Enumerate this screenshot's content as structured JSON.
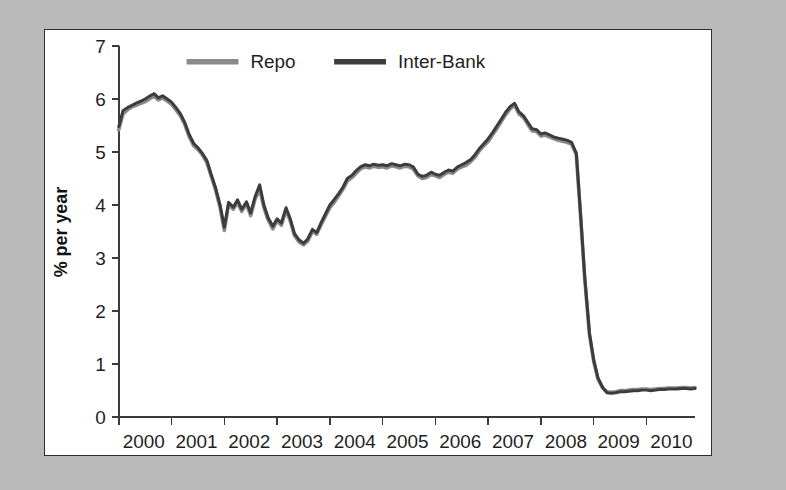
{
  "figure": {
    "background_color": "#b9b9b9",
    "panel_color": "#ffffff",
    "border_color": "#2e2e2e"
  },
  "chart_data": {
    "type": "line",
    "title": "",
    "xlabel": "",
    "ylabel": "% per year",
    "xlim": [
      2000,
      2010.92
    ],
    "ylim": [
      0,
      7
    ],
    "grid": false,
    "legend_position": "top-center",
    "xticks": [
      "2000",
      "2001",
      "2002",
      "2003",
      "2004",
      "2005",
      "2006",
      "2007",
      "2008",
      "2009",
      "2010"
    ],
    "yticks": [
      "0",
      "1",
      "2",
      "3",
      "4",
      "5",
      "6",
      "7"
    ],
    "colors": {
      "repo": "#8a8a8a",
      "inter_bank": "#3c3c3c"
    },
    "series": [
      {
        "name": "Repo",
        "color": "#8a8a8a",
        "x": [
          2000.0,
          2000.08,
          2000.17,
          2000.25,
          2000.33,
          2000.42,
          2000.5,
          2000.58,
          2000.67,
          2000.75,
          2000.83,
          2000.92,
          2001.0,
          2001.08,
          2001.17,
          2001.25,
          2001.33,
          2001.42,
          2001.5,
          2001.58,
          2001.67,
          2001.75,
          2001.83,
          2001.92,
          2002.0,
          2002.08,
          2002.17,
          2002.25,
          2002.33,
          2002.42,
          2002.5,
          2002.58,
          2002.67,
          2002.75,
          2002.83,
          2002.92,
          2003.0,
          2003.08,
          2003.17,
          2003.25,
          2003.33,
          2003.42,
          2003.5,
          2003.58,
          2003.67,
          2003.75,
          2003.83,
          2003.92,
          2004.0,
          2004.08,
          2004.17,
          2004.25,
          2004.33,
          2004.42,
          2004.5,
          2004.58,
          2004.67,
          2004.75,
          2004.83,
          2004.92,
          2005.0,
          2005.08,
          2005.17,
          2005.25,
          2005.33,
          2005.42,
          2005.5,
          2005.58,
          2005.67,
          2005.75,
          2005.83,
          2005.92,
          2006.0,
          2006.08,
          2006.17,
          2006.25,
          2006.33,
          2006.42,
          2006.5,
          2006.58,
          2006.67,
          2006.75,
          2006.83,
          2006.92,
          2007.0,
          2007.08,
          2007.17,
          2007.25,
          2007.33,
          2007.42,
          2007.5,
          2007.58,
          2007.67,
          2007.75,
          2007.83,
          2007.92,
          2008.0,
          2008.08,
          2008.17,
          2008.25,
          2008.33,
          2008.42,
          2008.5,
          2008.58,
          2008.67,
          2008.75,
          2008.83,
          2008.92,
          2009.0,
          2009.08,
          2009.17,
          2009.25,
          2009.33,
          2009.42,
          2009.5,
          2009.58,
          2009.67,
          2009.75,
          2009.83,
          2009.92,
          2010.0,
          2010.08,
          2010.17,
          2010.25,
          2010.33,
          2010.42,
          2010.5,
          2010.58,
          2010.67,
          2010.75,
          2010.83,
          2010.92
        ],
        "y": [
          5.42,
          5.72,
          5.8,
          5.85,
          5.88,
          5.92,
          5.95,
          6.0,
          6.05,
          5.98,
          6.02,
          5.96,
          5.9,
          5.8,
          5.68,
          5.52,
          5.3,
          5.12,
          5.05,
          4.95,
          4.8,
          4.55,
          4.3,
          3.95,
          3.52,
          4.0,
          3.92,
          4.05,
          3.88,
          4.02,
          3.8,
          4.1,
          4.3,
          3.95,
          3.72,
          3.55,
          3.7,
          3.62,
          3.9,
          3.7,
          3.42,
          3.3,
          3.25,
          3.32,
          3.5,
          3.45,
          3.62,
          3.8,
          3.95,
          4.05,
          4.18,
          4.3,
          4.45,
          4.52,
          4.6,
          4.68,
          4.72,
          4.7,
          4.73,
          4.71,
          4.72,
          4.7,
          4.74,
          4.72,
          4.7,
          4.73,
          4.72,
          4.68,
          4.55,
          4.5,
          4.52,
          4.58,
          4.55,
          4.52,
          4.58,
          4.62,
          4.6,
          4.68,
          4.72,
          4.75,
          4.82,
          4.9,
          5.02,
          5.12,
          5.2,
          5.32,
          5.45,
          5.58,
          5.7,
          5.82,
          5.88,
          5.72,
          5.65,
          5.52,
          5.4,
          5.38,
          5.3,
          5.32,
          5.28,
          5.25,
          5.22,
          5.2,
          5.18,
          5.15,
          4.95,
          3.8,
          2.6,
          1.55,
          1.05,
          0.72,
          0.55,
          0.48,
          0.47,
          0.48,
          0.5,
          0.5,
          0.51,
          0.52,
          0.52,
          0.53,
          0.53,
          0.52,
          0.53,
          0.54,
          0.54,
          0.55,
          0.55,
          0.55,
          0.56,
          0.56,
          0.55,
          0.56
        ]
      },
      {
        "name": "Inter-Bank",
        "color": "#3c3c3c",
        "x": [
          2000.0,
          2000.08,
          2000.17,
          2000.25,
          2000.33,
          2000.42,
          2000.5,
          2000.58,
          2000.67,
          2000.75,
          2000.83,
          2000.92,
          2001.0,
          2001.08,
          2001.17,
          2001.25,
          2001.33,
          2001.42,
          2001.5,
          2001.58,
          2001.67,
          2001.75,
          2001.83,
          2001.92,
          2002.0,
          2002.08,
          2002.17,
          2002.25,
          2002.33,
          2002.42,
          2002.5,
          2002.58,
          2002.67,
          2002.75,
          2002.83,
          2002.92,
          2003.0,
          2003.08,
          2003.17,
          2003.25,
          2003.33,
          2003.42,
          2003.5,
          2003.58,
          2003.67,
          2003.75,
          2003.83,
          2003.92,
          2004.0,
          2004.08,
          2004.17,
          2004.25,
          2004.33,
          2004.42,
          2004.5,
          2004.58,
          2004.67,
          2004.75,
          2004.83,
          2004.92,
          2005.0,
          2005.08,
          2005.17,
          2005.25,
          2005.33,
          2005.42,
          2005.5,
          2005.58,
          2005.67,
          2005.75,
          2005.83,
          2005.92,
          2006.0,
          2006.08,
          2006.17,
          2006.25,
          2006.33,
          2006.42,
          2006.5,
          2006.58,
          2006.67,
          2006.75,
          2006.83,
          2006.92,
          2007.0,
          2007.08,
          2007.17,
          2007.25,
          2007.33,
          2007.42,
          2007.5,
          2007.58,
          2007.67,
          2007.75,
          2007.83,
          2007.92,
          2008.0,
          2008.08,
          2008.17,
          2008.25,
          2008.33,
          2008.42,
          2008.5,
          2008.58,
          2008.67,
          2008.75,
          2008.83,
          2008.92,
          2009.0,
          2009.08,
          2009.17,
          2009.25,
          2009.33,
          2009.42,
          2009.5,
          2009.58,
          2009.67,
          2009.75,
          2009.83,
          2009.92,
          2010.0,
          2010.08,
          2010.17,
          2010.25,
          2010.33,
          2010.42,
          2010.5,
          2010.58,
          2010.67,
          2010.75,
          2010.83,
          2010.92
        ],
        "y": [
          5.48,
          5.78,
          5.84,
          5.88,
          5.92,
          5.96,
          6.0,
          6.05,
          6.1,
          6.02,
          6.06,
          6.0,
          5.94,
          5.84,
          5.72,
          5.56,
          5.34,
          5.16,
          5.08,
          4.98,
          4.84,
          4.58,
          4.34,
          4.0,
          3.58,
          4.05,
          3.96,
          4.1,
          3.92,
          4.06,
          3.85,
          4.15,
          4.38,
          4.0,
          3.76,
          3.6,
          3.74,
          3.66,
          3.95,
          3.74,
          3.46,
          3.34,
          3.28,
          3.36,
          3.54,
          3.48,
          3.66,
          3.84,
          4.0,
          4.1,
          4.22,
          4.34,
          4.5,
          4.56,
          4.65,
          4.72,
          4.76,
          4.74,
          4.77,
          4.75,
          4.76,
          4.74,
          4.78,
          4.76,
          4.74,
          4.77,
          4.76,
          4.72,
          4.58,
          4.54,
          4.56,
          4.62,
          4.58,
          4.56,
          4.62,
          4.66,
          4.64,
          4.72,
          4.76,
          4.8,
          4.86,
          4.95,
          5.06,
          5.16,
          5.25,
          5.36,
          5.5,
          5.62,
          5.75,
          5.86,
          5.92,
          5.76,
          5.68,
          5.56,
          5.44,
          5.42,
          5.34,
          5.36,
          5.32,
          5.28,
          5.26,
          5.24,
          5.22,
          5.18,
          4.98,
          3.84,
          2.64,
          1.58,
          1.08,
          0.74,
          0.56,
          0.46,
          0.45,
          0.46,
          0.48,
          0.48,
          0.49,
          0.5,
          0.5,
          0.51,
          0.51,
          0.5,
          0.51,
          0.52,
          0.52,
          0.53,
          0.53,
          0.53,
          0.54,
          0.54,
          0.53,
          0.54
        ]
      }
    ]
  },
  "legend": {
    "items": [
      {
        "label": "Repo",
        "color": "#8a8a8a"
      },
      {
        "label": "Inter-Bank",
        "color": "#3c3c3c"
      }
    ]
  }
}
